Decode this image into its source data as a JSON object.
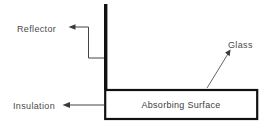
{
  "diagram": {
    "background_color": "#ffffff",
    "labels": {
      "reflector": "Reflector",
      "insulation": "Insulation",
      "glass": "Glass",
      "absorbing_surface": "Absorbing Surface"
    },
    "colors": {
      "outline": "#111111",
      "leader": "#444444",
      "text": "#4a4a4a",
      "fill": "#ffffff"
    },
    "parts": [
      {
        "name": "reflector",
        "label": "Reflector",
        "shape": "vertical-bar"
      },
      {
        "name": "absorbing-surface",
        "label": "Absorbing Surface",
        "shape": "rectangle"
      },
      {
        "name": "insulation",
        "label": "Insulation",
        "shape": "callout"
      },
      {
        "name": "glass",
        "label": "Glass",
        "shape": "callout"
      }
    ]
  }
}
